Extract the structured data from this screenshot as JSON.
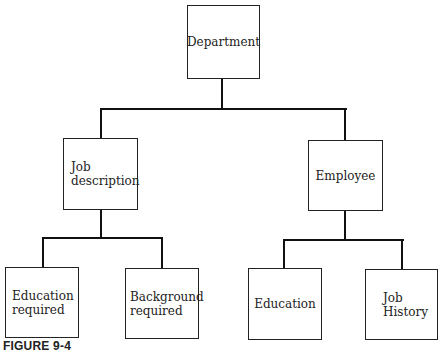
{
  "diagram": {
    "type": "hierarchy-tree",
    "root": {
      "label": "Department",
      "children": [
        {
          "label": "Job\ndescription",
          "children": [
            {
              "label": "Education\nrequired"
            },
            {
              "label": "Background\nrequired"
            }
          ]
        },
        {
          "label": "Employee",
          "children": [
            {
              "label": "Education"
            },
            {
              "label": "Job\nHistory"
            }
          ]
        }
      ]
    }
  },
  "nodes": {
    "department": "Department",
    "job_description": "Job\ndescription",
    "employee": "Employee",
    "education_required": "Education\nrequired",
    "background_required": "Background\nrequired",
    "education": "Education",
    "job_history": "Job\nHistory"
  },
  "caption": "FIGURE 9-4"
}
